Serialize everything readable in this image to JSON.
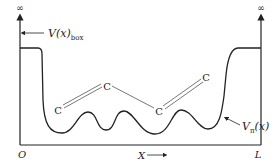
{
  "diagram": {
    "type": "potential-energy-diagram",
    "axis": {
      "top_left_label": "∞",
      "top_right_label": "∞",
      "origin_label": "O",
      "end_label": "L",
      "x_label": "X",
      "x_arrow": "⟶"
    },
    "labels": {
      "box_potential_main": "V(x)",
      "box_potential_sub": "box",
      "pi_potential_main": "V",
      "pi_potential_sub": "π",
      "pi_potential_arg": "(x)"
    },
    "atoms": [
      {
        "symbol": "C",
        "x": 58,
        "y": 111
      },
      {
        "symbol": "C",
        "x": 107,
        "y": 87
      },
      {
        "symbol": "C",
        "x": 159,
        "y": 112
      },
      {
        "symbol": "C",
        "x": 206,
        "y": 78
      }
    ],
    "bonds": [
      {
        "from": 0,
        "to": 1,
        "order": 2
      },
      {
        "from": 1,
        "to": 2,
        "order": 1
      },
      {
        "from": 2,
        "to": 3,
        "order": 2
      }
    ],
    "colors": {
      "line": "#222222",
      "background": "#ffffff"
    }
  }
}
